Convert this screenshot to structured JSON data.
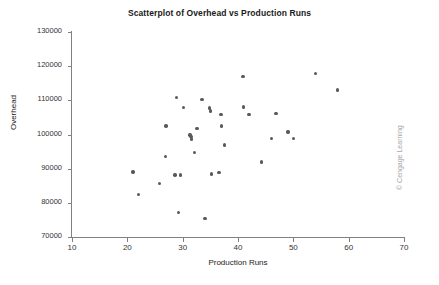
{
  "chart_data": {
    "type": "scatter",
    "title": "Scatterplot of Overhead vs Production Runs",
    "xlabel": "Production Runs",
    "ylabel": "Overhead",
    "xlim": [
      10,
      70
    ],
    "ylim": [
      70000,
      130000
    ],
    "xticks": [
      10,
      20,
      30,
      40,
      50,
      60,
      70
    ],
    "yticks": [
      70000,
      80000,
      90000,
      100000,
      110000,
      120000,
      130000
    ],
    "xtick_labels": [
      "10",
      "20",
      "30",
      "40",
      "50",
      "60",
      "70"
    ],
    "ytick_labels": [
      "70000",
      "80000",
      "90000",
      "100000",
      "110000",
      "120000",
      "130000"
    ],
    "grid": false,
    "legend": null,
    "marker_color": "#595959",
    "points": [
      {
        "x": 21.0,
        "y": 89000
      },
      {
        "x": 22.0,
        "y": 82400
      },
      {
        "x": 25.8,
        "y": 85700
      },
      {
        "x": 26.9,
        "y": 93500
      },
      {
        "x": 27.0,
        "y": 102500
      },
      {
        "x": 28.6,
        "y": 88100
      },
      {
        "x": 28.9,
        "y": 110800
      },
      {
        "x": 29.2,
        "y": 77100
      },
      {
        "x": 29.6,
        "y": 88200
      },
      {
        "x": 30.1,
        "y": 107900
      },
      {
        "x": 31.3,
        "y": 99800
      },
      {
        "x": 31.5,
        "y": 99400
      },
      {
        "x": 31.6,
        "y": 98700
      },
      {
        "x": 32.1,
        "y": 94800
      },
      {
        "x": 32.6,
        "y": 101700
      },
      {
        "x": 33.5,
        "y": 110200
      },
      {
        "x": 34.0,
        "y": 75500
      },
      {
        "x": 34.9,
        "y": 107800
      },
      {
        "x": 35.0,
        "y": 106900
      },
      {
        "x": 35.2,
        "y": 88400
      },
      {
        "x": 36.6,
        "y": 88900
      },
      {
        "x": 36.9,
        "y": 105900
      },
      {
        "x": 37.0,
        "y": 102500
      },
      {
        "x": 37.6,
        "y": 96900
      },
      {
        "x": 40.9,
        "y": 117000
      },
      {
        "x": 41.0,
        "y": 108100
      },
      {
        "x": 42.0,
        "y": 105800
      },
      {
        "x": 44.2,
        "y": 92000
      },
      {
        "x": 46.0,
        "y": 98800
      },
      {
        "x": 46.9,
        "y": 106100
      },
      {
        "x": 49.0,
        "y": 100700
      },
      {
        "x": 50.0,
        "y": 98900
      },
      {
        "x": 54.0,
        "y": 117900
      },
      {
        "x": 58.0,
        "y": 113000
      }
    ]
  },
  "credit": {
    "text": "© Cengage Learning"
  }
}
